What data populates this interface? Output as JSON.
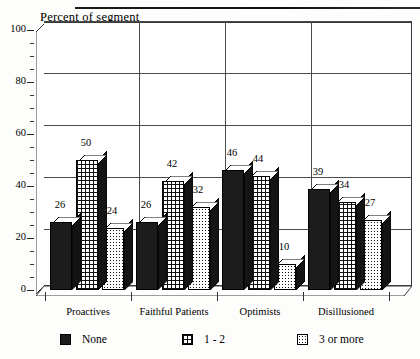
{
  "chart_data": {
    "type": "bar",
    "title": "",
    "ylabel": "Percent of segment",
    "xlabel": "",
    "ylim": [
      0,
      100
    ],
    "yticks": [
      0,
      20,
      40,
      60,
      80,
      100
    ],
    "grid": true,
    "legend_position": "bottom",
    "style": "3d-grouped-bar",
    "categories": [
      "Proactives",
      "Faithful Patients",
      "Optimists",
      "Disillusioned"
    ],
    "series": [
      {
        "name": "None",
        "pattern": "solid-dark",
        "values": [
          26,
          26,
          46,
          39
        ]
      },
      {
        "name": "1 - 2",
        "pattern": "grid",
        "values": [
          50,
          42,
          44,
          34
        ]
      },
      {
        "name": "3 or more",
        "pattern": "dots",
        "values": [
          24,
          32,
          10,
          27
        ]
      }
    ]
  },
  "axis": {
    "title": "Percent of segment",
    "ticks": [
      "100",
      "80",
      "60",
      "40",
      "20",
      "0"
    ]
  },
  "categories": [
    {
      "label": "Proactives"
    },
    {
      "label": "Faithful Patients"
    },
    {
      "label": "Optimists"
    },
    {
      "label": "Disillusioned"
    }
  ],
  "legend": [
    {
      "label": "None"
    },
    {
      "label": "1 - 2"
    },
    {
      "label": "3 or more"
    }
  ],
  "labels": {
    "g0": [
      "26",
      "50",
      "24"
    ],
    "g1": [
      "26",
      "42",
      "32"
    ],
    "g2": [
      "46",
      "44",
      "10"
    ],
    "g3": [
      "39",
      "34",
      "27"
    ]
  }
}
